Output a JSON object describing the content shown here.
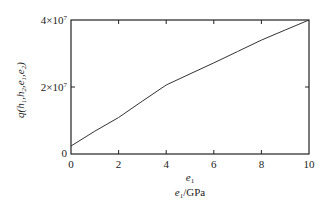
{
  "chart_data": {
    "type": "line",
    "title": "",
    "xlabel": "e1/GPa",
    "xlabel_symbol": "e1",
    "ylabel": "q(h1,h2,e1,e2)",
    "xlim": [
      0,
      10
    ],
    "ylim": [
      0,
      40000000
    ],
    "x_ticks": [
      0,
      2,
      4,
      6,
      8,
      10
    ],
    "x_tick_labels": [
      "0",
      "2",
      "4",
      "6",
      "8",
      "10"
    ],
    "y_ticks": [
      0,
      20000000,
      40000000
    ],
    "y_tick_labels": [
      "0",
      "2×10⁷",
      "4×10⁷"
    ],
    "grid": false,
    "legend": null,
    "series": [
      {
        "name": "q",
        "x": [
          0,
          1,
          2,
          3,
          4,
          5,
          6,
          7,
          8,
          9,
          10
        ],
        "values": [
          2400000,
          6800000,
          10900000,
          15800000,
          20600000,
          23900000,
          27200000,
          30600000,
          34000000,
          37000000,
          40000000
        ]
      }
    ],
    "colors": {
      "line": "#333333",
      "axes": "#222222"
    }
  },
  "labels": {
    "y_axis": "q(h1,h2,e1,e2)",
    "x_axis_symbol": "e1",
    "x_axis_unit": "e1/GPa"
  }
}
